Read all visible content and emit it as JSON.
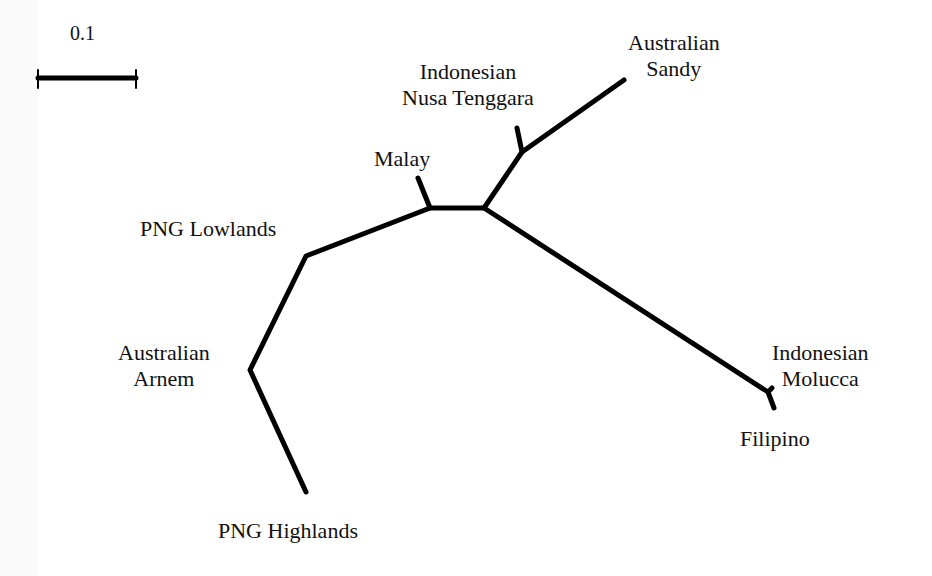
{
  "scale_bar": {
    "label": "0.1"
  },
  "taxa": {
    "australian_sandy": [
      "Australian",
      "Sandy"
    ],
    "indonesian_nusa_tenggara": [
      "Indonesian",
      "Nusa Tenggara"
    ],
    "malay": "Malay",
    "png_lowlands": "PNG Lowlands",
    "australian_arnem": [
      "Australian",
      "Arnem"
    ],
    "png_highlands": "PNG Highlands",
    "indonesian_molucca": [
      "Indonesian",
      "Molucca"
    ],
    "filipino": "Filipino"
  },
  "colors": {
    "branch": "#000000",
    "text": "#111111",
    "background": "#ffffff"
  }
}
